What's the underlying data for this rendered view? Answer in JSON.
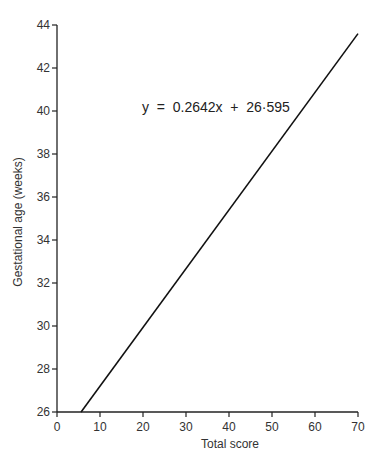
{
  "chart_data": {
    "type": "line",
    "title": "",
    "xlabel": "Total score",
    "ylabel": "Gestational age (weeks)",
    "xlim": [
      0,
      70
    ],
    "ylim": [
      26,
      44
    ],
    "x_ticks": [
      0,
      10,
      20,
      30,
      40,
      50,
      60,
      70
    ],
    "y_ticks": [
      26,
      28,
      30,
      32,
      34,
      36,
      38,
      40,
      42,
      44
    ],
    "grid": false,
    "legend": null,
    "annotations": [
      {
        "text": "y  =  0.2642x  +  26·595",
        "x": 37,
        "y": 40.5
      }
    ],
    "series": [
      {
        "name": "Regression line",
        "equation": {
          "slope": 0.2642,
          "intercept": 26.595
        },
        "x": [
          5.6,
          70
        ],
        "y": [
          26,
          43.6
        ]
      }
    ]
  }
}
